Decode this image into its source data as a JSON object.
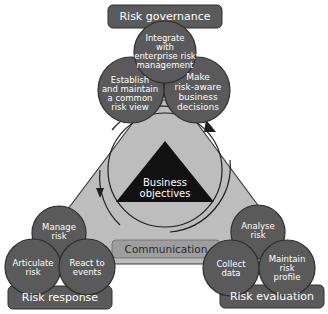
{
  "diagram": {
    "center": {
      "label_line1": "Business",
      "label_line2": "objectives"
    },
    "communication": {
      "label": "Communication"
    },
    "governance": {
      "label": "Risk governance",
      "items": [
        {
          "lines": [
            "Integrate",
            "with",
            "enterprise risk",
            "management"
          ]
        },
        {
          "lines": [
            "Establish",
            "and maintain",
            "a common",
            "risk view"
          ]
        },
        {
          "lines": [
            "Make",
            "risk-aware",
            "business",
            "decisions"
          ]
        }
      ]
    },
    "response": {
      "label": "Risk response",
      "items": [
        {
          "lines": [
            "Manage",
            "risk"
          ]
        },
        {
          "lines": [
            "Articulate",
            "risk"
          ]
        },
        {
          "lines": [
            "React to",
            "events"
          ]
        }
      ]
    },
    "evaluation": {
      "label": "Risk evaluation",
      "items": [
        {
          "lines": [
            "Analyse",
            "risk"
          ]
        },
        {
          "lines": [
            "Collect",
            "data"
          ]
        },
        {
          "lines": [
            "Maintain",
            "risk",
            "profile"
          ]
        }
      ]
    },
    "colors": {
      "circle": "#5a5a5a",
      "circle_stroke": "#2e2e2e",
      "box": "#5a5a5a",
      "triangle_fill": "#bdbdbd",
      "triangle_stroke": "#3a3a3a",
      "communication_fill": "#9e9e9e",
      "center_triangle": "#111111"
    }
  }
}
